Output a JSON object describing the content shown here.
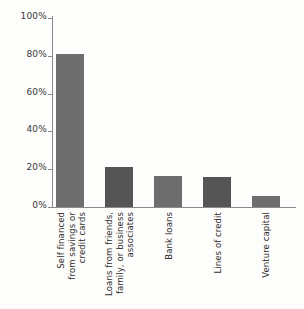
{
  "chart_data": {
    "type": "bar",
    "title": "",
    "subtitle": "",
    "xlabel": "",
    "ylabel": "",
    "ylim": [
      0,
      100
    ],
    "grid": false,
    "legend": false,
    "y_unit": "%",
    "categories": [
      "Self financed\nfrom savings or\ncredit cards",
      "Loans from friends,\nfamily, or business\nassociates",
      "Bank loans",
      "Lines of credit",
      "Venture capital"
    ],
    "values": [
      81,
      21,
      16.5,
      16,
      6
    ],
    "y_ticks": [
      0,
      20,
      40,
      60,
      80,
      100
    ],
    "y_tick_labels": [
      "0%",
      "20%",
      "40%",
      "60%",
      "80%",
      "100%"
    ],
    "bar_colors": [
      "#6e6e6e",
      "#555555",
      "#6e6e6e",
      "#555555",
      "#6e6e6e"
    ],
    "axis_color": "#8a8a8a",
    "background_color": "#fdfdfb",
    "text_color": "#2e2e2e"
  }
}
